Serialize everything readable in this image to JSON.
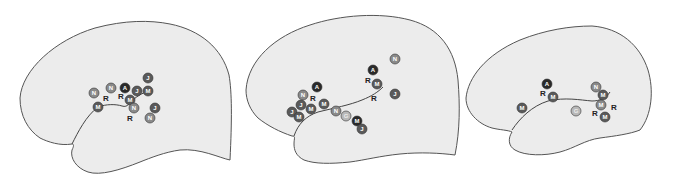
{
  "colors": {
    "background": "#ffffff",
    "brain_fill": "#ececec",
    "brain_stroke": "#555555",
    "marker_dark": "#2a2a2a",
    "marker_mid": "#5a5a5a",
    "marker_gray": "#8a8a8a",
    "marker_light": "#b8b8b8",
    "marker_text_light": "#ffffff",
    "marker_text_dark": "#ececec"
  },
  "legend_note": "Circled letters denote subject/site markers; plain R denotes unfilled label",
  "brains": [
    {
      "id": "brain-1",
      "markers": [
        {
          "label": "N",
          "x": 94,
          "y": 93,
          "shade": "gray"
        },
        {
          "label": "R",
          "x": 106,
          "y": 98,
          "shade": "plain"
        },
        {
          "label": "N",
          "x": 111,
          "y": 88,
          "shade": "gray"
        },
        {
          "label": "A",
          "x": 125,
          "y": 88,
          "shade": "dark"
        },
        {
          "label": "R",
          "x": 121,
          "y": 96,
          "shade": "plain"
        },
        {
          "label": "J",
          "x": 137,
          "y": 91,
          "shade": "mid"
        },
        {
          "label": "M",
          "x": 148,
          "y": 91,
          "shade": "mid"
        },
        {
          "label": "J",
          "x": 148,
          "y": 78,
          "shade": "mid"
        },
        {
          "label": "M",
          "x": 130,
          "y": 100,
          "shade": "mid"
        },
        {
          "label": "N",
          "x": 134,
          "y": 108,
          "shade": "gray"
        },
        {
          "label": "M",
          "x": 98,
          "y": 107,
          "shade": "mid"
        },
        {
          "label": "R",
          "x": 130,
          "y": 118,
          "shade": "plain"
        },
        {
          "label": "J",
          "x": 155,
          "y": 108,
          "shade": "mid"
        },
        {
          "label": "N",
          "x": 150,
          "y": 118,
          "shade": "gray"
        }
      ]
    },
    {
      "id": "brain-2",
      "markers": [
        {
          "label": "A",
          "x": 317,
          "y": 87,
          "shade": "dark"
        },
        {
          "label": "N",
          "x": 303,
          "y": 95,
          "shade": "gray"
        },
        {
          "label": "R",
          "x": 313,
          "y": 98,
          "shade": "plain"
        },
        {
          "label": "J",
          "x": 301,
          "y": 105,
          "shade": "mid"
        },
        {
          "label": "M",
          "x": 311,
          "y": 109,
          "shade": "mid"
        },
        {
          "label": "M",
          "x": 324,
          "y": 104,
          "shade": "mid"
        },
        {
          "label": "J",
          "x": 292,
          "y": 112,
          "shade": "mid"
        },
        {
          "label": "M",
          "x": 299,
          "y": 117,
          "shade": "mid"
        },
        {
          "label": "N",
          "x": 336,
          "y": 111,
          "shade": "gray"
        },
        {
          "label": "G",
          "x": 346,
          "y": 116,
          "shade": "light"
        },
        {
          "label": "M",
          "x": 357,
          "y": 121,
          "shade": "dark"
        },
        {
          "label": "J",
          "x": 362,
          "y": 129,
          "shade": "mid"
        },
        {
          "label": "A",
          "x": 373,
          "y": 70,
          "shade": "dark"
        },
        {
          "label": "R",
          "x": 368,
          "y": 80,
          "shade": "plain"
        },
        {
          "label": "M",
          "x": 377,
          "y": 84,
          "shade": "mid"
        },
        {
          "label": "N",
          "x": 395,
          "y": 59,
          "shade": "gray"
        },
        {
          "label": "R",
          "x": 374,
          "y": 98,
          "shade": "plain"
        },
        {
          "label": "J",
          "x": 395,
          "y": 94,
          "shade": "mid"
        }
      ]
    },
    {
      "id": "brain-3",
      "markers": [
        {
          "label": "A",
          "x": 547,
          "y": 84,
          "shade": "dark"
        },
        {
          "label": "R",
          "x": 543,
          "y": 93,
          "shade": "plain"
        },
        {
          "label": "M",
          "x": 553,
          "y": 97,
          "shade": "mid"
        },
        {
          "label": "M",
          "x": 522,
          "y": 108,
          "shade": "mid"
        },
        {
          "label": "G",
          "x": 576,
          "y": 111,
          "shade": "light"
        },
        {
          "label": "N",
          "x": 596,
          "y": 87,
          "shade": "gray"
        },
        {
          "label": "M",
          "x": 603,
          "y": 95,
          "shade": "mid"
        },
        {
          "label": "M",
          "x": 601,
          "y": 105,
          "shade": "gray"
        },
        {
          "label": "R",
          "x": 614,
          "y": 107,
          "shade": "plain"
        },
        {
          "label": "R",
          "x": 595,
          "y": 113,
          "shade": "plain"
        },
        {
          "label": "M",
          "x": 605,
          "y": 117,
          "shade": "mid"
        }
      ]
    }
  ]
}
